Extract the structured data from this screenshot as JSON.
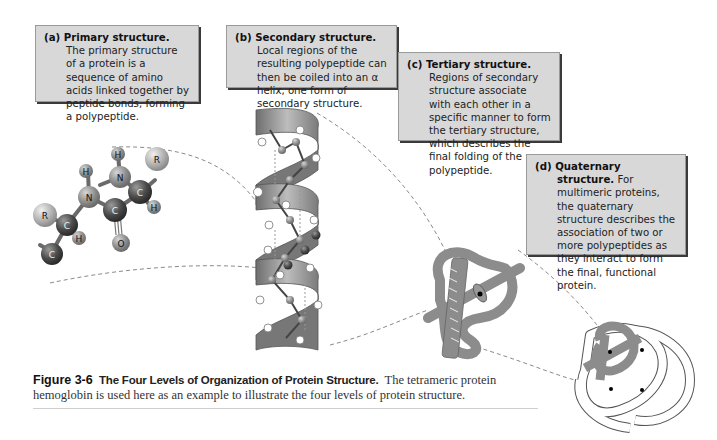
{
  "figure": {
    "number": "Figure 3-6",
    "title": "The Four Levels of Organization of Protein Structure.",
    "caption_body": "The tetrameric protein hemoglobin is used here as an example to illustrate the four levels of protein structure."
  },
  "panels": [
    {
      "id": "a",
      "label": "(a) Primary structure.",
      "text": "The primary structure of a protein is a sequence of amino acids linked together by peptide bonds, forming a polypeptide."
    },
    {
      "id": "b",
      "label": "(b) Secondary structure.",
      "text": "Local regions of the resulting polypeptide can then be coiled into an α helix, one form of secondary structure."
    },
    {
      "id": "c",
      "label": "(c) Tertiary structure.",
      "text": "Regions of secondary structure associate with each other in a specific manner to form the tertiary structure, which describes the final folding of the polypeptide."
    },
    {
      "id": "d",
      "label": "(d) Quaternary structure.",
      "text": "For multimeric proteins, the quaternary structure describes the association of two or more polypeptides as they interact to form the final, functional protein."
    }
  ],
  "molecule": {
    "atoms": [
      {
        "symbol": "H"
      },
      {
        "symbol": "N"
      },
      {
        "symbol": "R"
      },
      {
        "symbol": "C"
      },
      {
        "symbol": "H"
      },
      {
        "symbol": "H"
      },
      {
        "symbol": "N"
      },
      {
        "symbol": "C"
      },
      {
        "symbol": "O"
      },
      {
        "symbol": "R"
      },
      {
        "symbol": "C"
      },
      {
        "symbol": "H"
      },
      {
        "symbol": "C"
      }
    ]
  },
  "colors": {
    "box_fill": "#d8d8d8",
    "box_border": "#9a9a9a",
    "box_shadow": "#3a3a3a",
    "ribbon_gray": "#8c8c8c",
    "dashed_line": "#8a8a8a"
  }
}
